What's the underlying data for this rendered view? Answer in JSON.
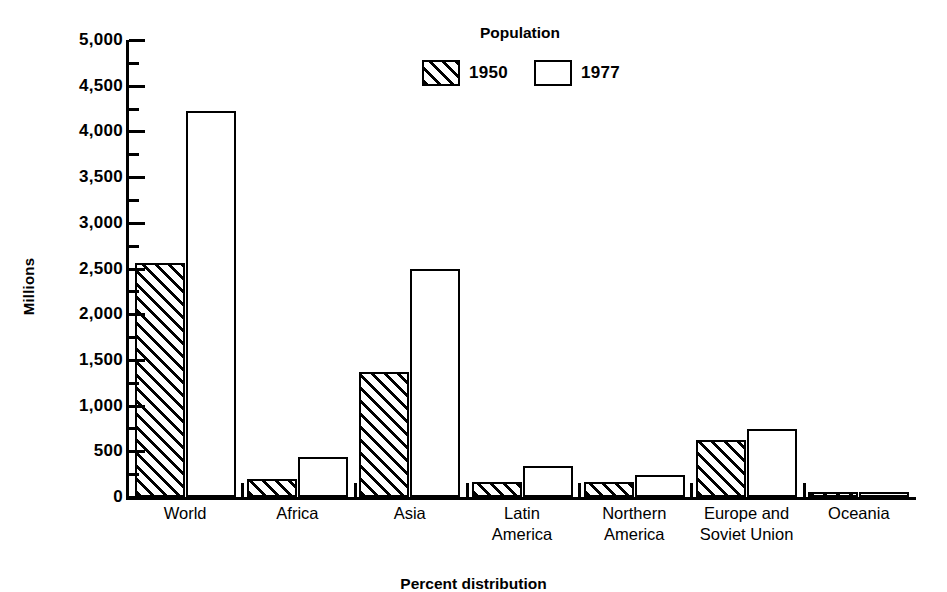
{
  "chart_data": {
    "type": "bar",
    "title": "Population",
    "xlabel": "",
    "ylabel": "Millions",
    "ylim": [
      0,
      5000
    ],
    "ytick_step": 500,
    "grid": false,
    "legend_position": "top-center",
    "categories": [
      "World",
      "Africa",
      "Asia",
      "Latin\nAmerica",
      "Northern\nAmerica",
      "Europe and\nSoviet Union",
      "Oceania"
    ],
    "ytick_labels": [
      "0",
      "500",
      "1,000",
      "1,500",
      "2,000",
      "2,500",
      "3,000",
      "3,500",
      "4,000",
      "4,500",
      "5,000"
    ],
    "ytick_values": [
      0,
      500,
      1000,
      1500,
      2000,
      2500,
      3000,
      3500,
      4000,
      4500,
      5000
    ],
    "series": [
      {
        "name": "1950",
        "fill": "hatched",
        "values": [
          2560,
          200,
          1370,
          165,
          166,
          620,
          13
        ]
      },
      {
        "name": "1977",
        "fill": "white",
        "values": [
          4220,
          440,
          2490,
          340,
          242,
          740,
          22
        ]
      }
    ],
    "caption": "Percent distribution"
  },
  "legend": {
    "title": "Population",
    "entries": [
      {
        "label": "1950",
        "fill": "hatched"
      },
      {
        "label": "1977",
        "fill": "white"
      }
    ]
  },
  "axes": {
    "y_title": "Millions"
  },
  "colors": {
    "ink": "#000000",
    "background": "#ffffff"
  }
}
